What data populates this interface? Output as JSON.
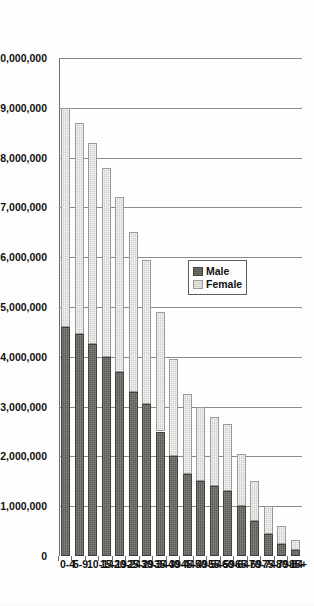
{
  "chart_data": {
    "type": "bar",
    "subtype": "stacked-horizontal-population-pyramid",
    "orientation": "rotated-90-clockwise",
    "title": "",
    "xlabel": "",
    "ylabel": "",
    "categories": [
      "0-4",
      "5-9",
      "10-14",
      "15-19",
      "20-24",
      "25-29",
      "30-34",
      "35-39",
      "40-44",
      "45-49",
      "50-54",
      "55-59",
      "60-64",
      "65-69",
      "70-74",
      "75-79",
      "80-84",
      "85+"
    ],
    "series": [
      {
        "name": "Male",
        "color": "#5c5c57",
        "values": [
          4600000,
          4450000,
          4250000,
          4000000,
          3700000,
          3300000,
          3050000,
          2500000,
          2000000,
          1650000,
          1500000,
          1400000,
          1300000,
          1000000,
          700000,
          450000,
          250000,
          120000
        ]
      },
      {
        "name": "Female",
        "color": "#cfcfcb",
        "values": [
          4400000,
          4250000,
          4050000,
          3800000,
          3500000,
          3200000,
          2900000,
          2400000,
          1950000,
          1600000,
          1500000,
          1400000,
          1350000,
          1050000,
          800000,
          550000,
          350000,
          200000
        ]
      }
    ],
    "stacked_totals": [
      9000000,
      8700000,
      8300000,
      7800000,
      7200000,
      6500000,
      5950000,
      4900000,
      3950000,
      3250000,
      3000000,
      2800000,
      2650000,
      2050000,
      1500000,
      1000000,
      600000,
      320000
    ],
    "value_axis": {
      "ticks": [
        10000000,
        9000000,
        8000000,
        7000000,
        6000000,
        5000000,
        4000000,
        3000000,
        2000000,
        1000000,
        0
      ],
      "tick_labels": [
        "10,000,000",
        "9,000,000",
        "8,000,000",
        "7,000,000",
        "6,000,000",
        "5,000,000",
        "4,000,000",
        "3,000,000",
        "2,000,000",
        "1,000,000",
        "0"
      ],
      "min": 0,
      "max": 10000000,
      "direction": "reversed-right-to-left"
    },
    "grid": true,
    "legend": {
      "position": "inside-upper-left",
      "entries": [
        "Male",
        "Female"
      ]
    }
  },
  "legend": {
    "male_label": "Male",
    "female_label": "Female"
  }
}
